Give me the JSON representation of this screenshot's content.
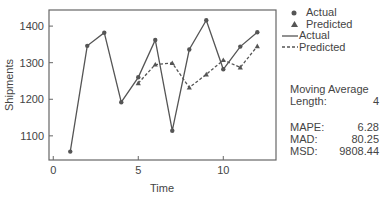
{
  "chart_data": {
    "type": "line",
    "title": "",
    "xlabel": "Time",
    "ylabel": "Shipments",
    "x": [
      1,
      2,
      3,
      4,
      5,
      6,
      7,
      8,
      9,
      10,
      11,
      12
    ],
    "series": [
      {
        "name": "Actual",
        "style": "solid-circle",
        "values": [
          1057,
          1346,
          1382,
          1192,
          1260,
          1362,
          1114,
          1336,
          1416,
          1282,
          1344,
          1383
        ]
      },
      {
        "name": "Predicted",
        "style": "dashed-triangle",
        "values": [
          null,
          null,
          null,
          null,
          1244,
          1295,
          1299,
          1232,
          1268,
          1307,
          1287,
          1345
        ]
      }
    ],
    "xlim": [
      -0.25,
      13.1
    ],
    "ylim": [
      1034,
      1444
    ],
    "xticks": [
      0,
      5,
      10
    ],
    "yticks": [
      1100,
      1200,
      1300,
      1400
    ],
    "grid": false,
    "legend_position": "right"
  },
  "legend": {
    "items": [
      {
        "symbol": "●",
        "label": "Actual"
      },
      {
        "symbol": "▲",
        "label": "Predicted"
      },
      {
        "symbol": "line",
        "label": "Actual"
      },
      {
        "symbol": "dash",
        "label": "Predicted"
      }
    ]
  },
  "stats": {
    "method_label": "Moving Average",
    "length_label": "Length:",
    "length_value": "4",
    "mape_label": "MAPE:",
    "mape_value": "6.28",
    "mad_label": "MAD:",
    "mad_value": "80.25",
    "msd_label": "MSD:",
    "msd_value": "9808.44"
  },
  "colors": {
    "line": "#555555",
    "frame": "#666666",
    "text": "#444444"
  }
}
